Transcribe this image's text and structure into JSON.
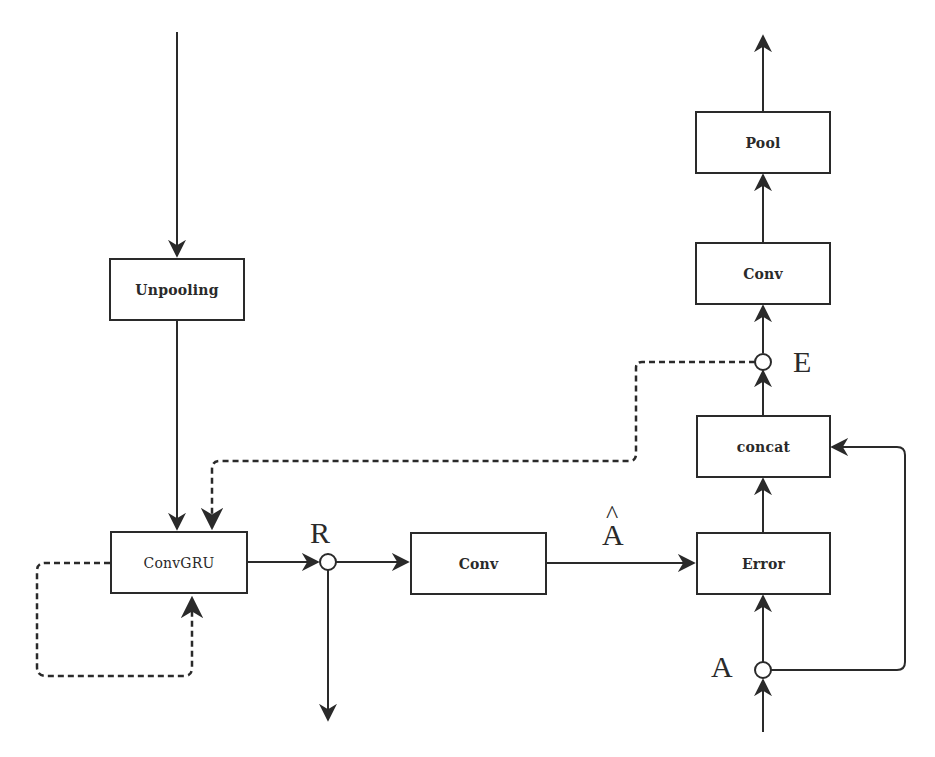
{
  "diagram": {
    "nodes": {
      "unpooling": "Unpooling",
      "convgru": "ConvGRU",
      "conv_mid": "Conv",
      "error": "Error",
      "concat": "concat",
      "conv_top": "Conv",
      "pool": "Pool"
    },
    "labels": {
      "R": "R",
      "A_hat": "A",
      "A_hat_accent": "^",
      "A": "A",
      "E": "E"
    },
    "colors": {
      "line": "#2a2a2a",
      "background": "#ffffff"
    },
    "edges": [
      {
        "from": "top-input",
        "to": "Unpooling",
        "style": "solid"
      },
      {
        "from": "Unpooling",
        "to": "ConvGRU",
        "style": "solid"
      },
      {
        "from": "E",
        "to": "ConvGRU",
        "style": "dashed"
      },
      {
        "from": "ConvGRU",
        "to": "ConvGRU",
        "style": "dashed",
        "note": "recurrent loop"
      },
      {
        "from": "ConvGRU",
        "to": "R",
        "style": "solid"
      },
      {
        "from": "R",
        "to": "Conv",
        "style": "solid"
      },
      {
        "from": "R",
        "to": "bottom-output",
        "style": "solid"
      },
      {
        "from": "Conv",
        "to": "Error",
        "style": "solid",
        "label": "Â"
      },
      {
        "from": "A",
        "to": "Error",
        "style": "solid"
      },
      {
        "from": "A",
        "to": "concat",
        "style": "solid"
      },
      {
        "from": "Error",
        "to": "concat",
        "style": "solid"
      },
      {
        "from": "concat",
        "to": "E",
        "style": "solid"
      },
      {
        "from": "E",
        "to": "Conv (top)",
        "style": "solid"
      },
      {
        "from": "Conv (top)",
        "to": "Pool",
        "style": "solid"
      },
      {
        "from": "Pool",
        "to": "top-output",
        "style": "solid"
      },
      {
        "from": "bottom-input",
        "to": "A",
        "style": "solid"
      }
    ]
  }
}
